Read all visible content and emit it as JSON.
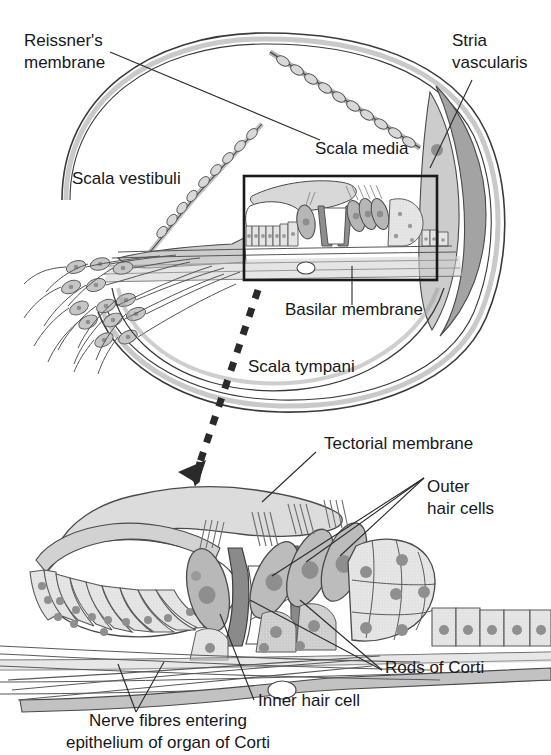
{
  "figure": {
    "background_color": "#ffffff",
    "ink_color": "#17171a"
  },
  "palette": {
    "outline": "#3a3a3a",
    "light_gray": "#e2e2e2",
    "mid_gray": "#c9c9c9",
    "dark_gray": "#a8a8a8",
    "darker_gray": "#8e8e8e",
    "nucleus_gray": "#9a9a9a",
    "white_fill": "#ffffff",
    "leader_line": "#2a2a2a"
  },
  "upper_diagram": {
    "name": "cochlear-duct-cross-section",
    "labels": [
      {
        "id": "reissners-membrane",
        "text_lines": [
          "Reissner's",
          "membrane"
        ],
        "x": 24,
        "y": 46,
        "anchor": "start"
      },
      {
        "id": "stria-vascularis",
        "text_lines": [
          "Stria",
          "vascularis"
        ],
        "x": 452,
        "y": 46,
        "anchor": "start"
      },
      {
        "id": "scala-vestibuli",
        "text_lines": [
          "Scala vestibuli"
        ],
        "x": 72,
        "y": 184,
        "anchor": "start"
      },
      {
        "id": "scala-media",
        "text_lines": [
          "Scala media"
        ],
        "x": 315,
        "y": 154,
        "anchor": "start"
      },
      {
        "id": "scala-tympani",
        "text_lines": [
          "Scala tympani"
        ],
        "x": 248,
        "y": 372,
        "anchor": "start"
      },
      {
        "id": "basilar-membrane",
        "text_lines": [
          "Basilar membrane"
        ],
        "x": 285,
        "y": 315,
        "anchor": "start"
      }
    ],
    "inset_box": {
      "x": 244,
      "y": 176,
      "width": 193,
      "height": 104
    }
  },
  "lower_diagram": {
    "name": "organ-of-corti-detail",
    "labels": [
      {
        "id": "tectorial-membrane",
        "text_lines": [
          "Tectorial membrane"
        ],
        "x": 324,
        "y": 449,
        "anchor": "start"
      },
      {
        "id": "outer-hair-cells",
        "text_lines": [
          "Outer",
          "hair cells"
        ],
        "x": 427,
        "y": 492,
        "anchor": "start"
      },
      {
        "id": "rods-of-corti",
        "text_lines": [
          "Rods of Corti"
        ],
        "x": 385,
        "y": 673,
        "anchor": "start"
      },
      {
        "id": "inner-hair-cell",
        "text_lines": [
          "Inner hair cell"
        ],
        "x": 258,
        "y": 706,
        "anchor": "start"
      },
      {
        "id": "nerve-fibres",
        "text_lines": [
          "Nerve fibres entering",
          "epithelium of organ of Corti"
        ],
        "x": 168,
        "y": 726,
        "anchor": "middle"
      }
    ]
  },
  "connector": {
    "name": "magnification-arrow",
    "style": "dashed-arrow",
    "from": {
      "x": 258,
      "y": 288
    },
    "to": {
      "x": 198,
      "y": 478
    }
  }
}
